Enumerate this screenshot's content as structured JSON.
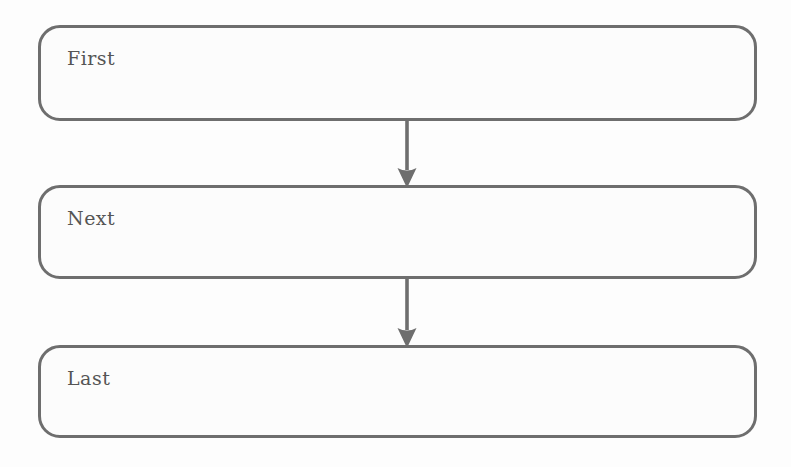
{
  "diagram": {
    "type": "flowchart",
    "orientation": "top-to-bottom",
    "background_color": "#fdfdfd",
    "node_fill_color": "#fcfcfc",
    "node_border_color": "#6e6e6e",
    "arrow_color": "#6e6e6e",
    "text_color": "#555555",
    "nodes": [
      {
        "id": "first",
        "label": "First"
      },
      {
        "id": "next",
        "label": "Next"
      },
      {
        "id": "last",
        "label": "Last"
      }
    ],
    "edges": [
      {
        "id": "first-next",
        "from": "First",
        "to": "Next",
        "marker": "arrow-down-icon"
      },
      {
        "id": "next-last",
        "from": "Next",
        "to": "Last",
        "marker": "arrow-down-icon"
      }
    ]
  }
}
